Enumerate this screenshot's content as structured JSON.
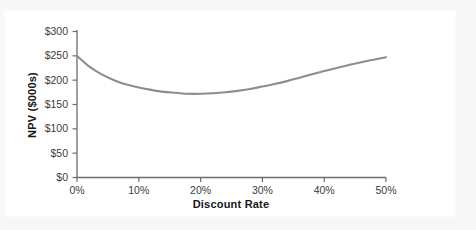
{
  "chart_data": {
    "type": "line",
    "title": "",
    "xlabel": "Discount Rate",
    "ylabel": "NPV ($000s)",
    "xlim": [
      0,
      50
    ],
    "ylim": [
      0,
      300
    ],
    "grid": false,
    "legend": "none",
    "line_color": "#8d8d8d",
    "axis_color": "#6d6d6d",
    "text_color": "#2c2c2c",
    "x_tick_labels": [
      "0%",
      "10%",
      "20%",
      "30%",
      "40%",
      "50%"
    ],
    "x_tick_values": [
      0,
      10,
      20,
      30,
      40,
      50
    ],
    "y_tick_labels": [
      "$0",
      "$50",
      "$100",
      "$150",
      "$200",
      "$250",
      "$300"
    ],
    "y_tick_values": [
      0,
      50,
      100,
      150,
      200,
      250,
      300
    ],
    "series": [
      {
        "name": "NPV",
        "x": [
          0,
          2,
          4,
          6,
          8,
          10,
          12,
          14,
          16,
          18,
          20,
          22,
          24,
          26,
          28,
          30,
          32,
          34,
          36,
          38,
          40,
          42,
          44,
          46,
          48,
          50
        ],
        "values": [
          250,
          228,
          212,
          200,
          191,
          185,
          180,
          176,
          174,
          172,
          172,
          173,
          175,
          178,
          182,
          187,
          192,
          198,
          205,
          212,
          219,
          225,
          231,
          237,
          242,
          247
        ]
      }
    ],
    "annotations": []
  },
  "axes": {
    "y_title": "NPV ($000s)",
    "x_title": "Discount Rate"
  }
}
